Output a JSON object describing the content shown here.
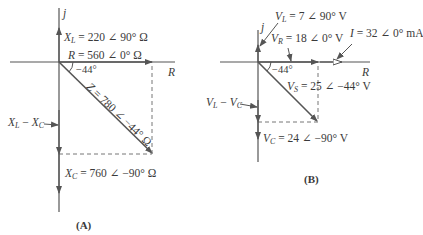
{
  "diagram_a": {
    "caption": "(A)",
    "axis_imag": "j",
    "axis_real": "R",
    "xl": {
      "sym": "X",
      "sub": "L",
      "value": " = 220 ∠ 90° Ω"
    },
    "r": {
      "sym": "R",
      "value": " = 560 ∠ 0° Ω"
    },
    "angle": "−44°",
    "z": {
      "sym": "Z",
      "value": " = 780 ∠ −44° Ω"
    },
    "xl_minus_xc": {
      "a": "X",
      "a_sub": "L",
      "op": " − ",
      "b": "X",
      "b_sub": "C"
    },
    "xc": {
      "sym": "X",
      "sub": "C",
      "value": " = 760 ∠ −90° Ω"
    }
  },
  "diagram_b": {
    "caption": "(B)",
    "axis_imag": "j",
    "axis_real": "R",
    "vl": {
      "sym": "V",
      "sub": "L",
      "value": " = 7 ∠ 90° V"
    },
    "vr": {
      "sym": "V",
      "sub": "R",
      "value": " = 18 ∠ 0° V"
    },
    "i": {
      "sym": "I",
      "value": " = 32 ∠ 0° mA"
    },
    "angle": "−44°",
    "vs": {
      "sym": "V",
      "sub": "S",
      "value": " = 25 ∠ −44° V"
    },
    "vl_minus_vc": {
      "a": "V",
      "a_sub": "L",
      "op": " − ",
      "b": "V",
      "b_sub": "C"
    },
    "vc": {
      "sym": "V",
      "sub": "C",
      "value": " = 24 ∠ −90° V"
    }
  },
  "colors": {
    "line": "#555555",
    "dash": "#777777"
  }
}
